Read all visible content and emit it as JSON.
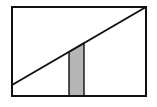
{
  "diagram": {
    "type": "geometric",
    "colors": {
      "background": "#ffffff",
      "stroke": "#111111",
      "strip_fill": "#b5b5b5"
    },
    "rectangle": {
      "x": 12,
      "y": 7,
      "width": 134,
      "height": 89
    },
    "diagonal": {
      "x1": 12,
      "y1": 85,
      "x2": 146,
      "y2": 7
    },
    "strip": {
      "x_left": 69,
      "x_right": 84,
      "bottom": 96
    }
  }
}
